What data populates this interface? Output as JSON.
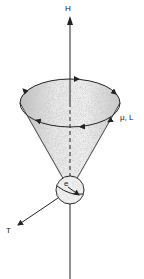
{
  "diagram": {
    "labels": {
      "field": "H",
      "moment": "μ, L",
      "torque": "T",
      "electron": "e"
    },
    "colors": {
      "line": "#222222",
      "shading": "#9a9a9a",
      "background": "#ffffff"
    }
  }
}
